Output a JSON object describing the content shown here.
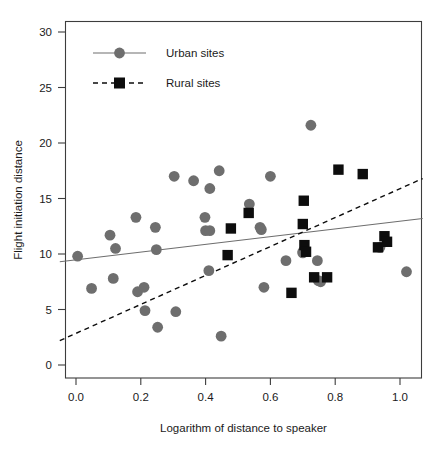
{
  "chart_data": {
    "type": "scatter",
    "title": "",
    "xlabel": "Logarithm of distance to speaker",
    "ylabel": "Flight initiation distance",
    "xlim": [
      -0.05,
      1.07
    ],
    "ylim": [
      -1.2,
      31.5
    ],
    "xticks": [
      "0.0",
      "0.2",
      "0.4",
      "0.6",
      "0.8",
      "1.0"
    ],
    "xtick_values": [
      0.0,
      0.2,
      0.4,
      0.6,
      0.8,
      1.0
    ],
    "yticks": [
      "0",
      "5",
      "10",
      "15",
      "20",
      "25",
      "30"
    ],
    "ytick_values": [
      0,
      5,
      10,
      15,
      20,
      25,
      30
    ],
    "grid": false,
    "legend_position": "top-left",
    "series": [
      {
        "name": "Urban sites",
        "marker": "circle",
        "color": "#6e6e6e",
        "line_style": "solid",
        "points": [
          [
            0.005,
            9.8
          ],
          [
            0.048,
            6.9
          ],
          [
            0.105,
            11.7
          ],
          [
            0.115,
            7.8
          ],
          [
            0.122,
            10.5
          ],
          [
            0.185,
            13.3
          ],
          [
            0.19,
            6.6
          ],
          [
            0.21,
            7.0
          ],
          [
            0.213,
            4.9
          ],
          [
            0.245,
            12.4
          ],
          [
            0.248,
            10.4
          ],
          [
            0.252,
            3.4
          ],
          [
            0.303,
            17.0
          ],
          [
            0.308,
            4.8
          ],
          [
            0.363,
            16.6
          ],
          [
            0.398,
            13.3
          ],
          [
            0.4,
            12.1
          ],
          [
            0.413,
            12.1
          ],
          [
            0.413,
            15.9
          ],
          [
            0.41,
            8.5
          ],
          [
            0.442,
            17.5
          ],
          [
            0.448,
            2.6
          ],
          [
            0.535,
            14.5
          ],
          [
            0.568,
            12.4
          ],
          [
            0.572,
            12.2
          ],
          [
            0.58,
            7.0
          ],
          [
            0.6,
            17.0
          ],
          [
            0.648,
            9.4
          ],
          [
            0.7,
            10.1
          ],
          [
            0.7,
            10.2
          ],
          [
            0.705,
            10.4
          ],
          [
            0.725,
            21.6
          ],
          [
            0.745,
            9.4
          ],
          [
            0.748,
            7.6
          ],
          [
            0.755,
            7.5
          ],
          [
            0.938,
            10.6
          ],
          [
            1.02,
            8.4
          ]
        ]
      },
      {
        "name": "Rural sites",
        "marker": "square",
        "color": "#0d0d0d",
        "line_style": "dashed",
        "points": [
          [
            0.468,
            9.9
          ],
          [
            0.478,
            12.3
          ],
          [
            0.533,
            13.7
          ],
          [
            0.665,
            6.5
          ],
          [
            0.7,
            12.7
          ],
          [
            0.703,
            14.8
          ],
          [
            0.705,
            10.8
          ],
          [
            0.71,
            10.2
          ],
          [
            0.735,
            7.9
          ],
          [
            0.775,
            7.9
          ],
          [
            0.81,
            17.6
          ],
          [
            0.885,
            17.2
          ],
          [
            0.932,
            10.6
          ],
          [
            0.952,
            11.6
          ],
          [
            0.96,
            11.1
          ]
        ]
      }
    ],
    "trend_lines": [
      {
        "name": "Urban sites fit",
        "style": "solid",
        "color": "#6e6e6e",
        "x_start": -0.05,
        "y_start": 9.3,
        "x_end": 1.07,
        "y_end": 13.2
      },
      {
        "name": "Rural sites fit",
        "style": "dashed",
        "color": "#0d0d0d",
        "x_start": -0.05,
        "y_start": 2.2,
        "x_end": 1.07,
        "y_end": 16.8
      }
    ]
  },
  "legend": {
    "entries": [
      {
        "label": "Urban sites"
      },
      {
        "label": "Rural sites"
      }
    ]
  }
}
